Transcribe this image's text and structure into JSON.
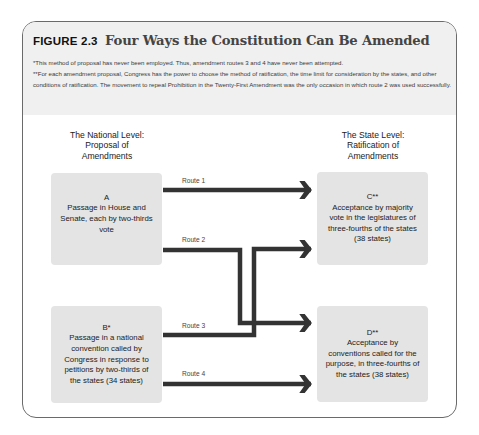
{
  "figure": {
    "label": "FIGURE 2.3",
    "title": "Four Ways the Constitution Can Be Amended",
    "notes": [
      "*This method of proposal has never been employed. Thus, amendment routes 3 and 4 have never been attempted.",
      "**For each amendment proposal, Congress has the power to choose the method of ratification, the time limit for consideration by the states, and other conditions of ratification. The movement to repeal Prohibition in the Twenty-First Amendment was the only occasion in which route 2 was used successfully."
    ]
  },
  "columns": {
    "national": {
      "line1": "The National Level:",
      "line2": "Proposal of",
      "line3": "Amendments"
    },
    "state": {
      "line1": "The State Level:",
      "line2": "Ratification of",
      "line3": "Amendments"
    }
  },
  "boxes": {
    "A": {
      "id": "A",
      "text": "Passage in House and Senate, each by two-thirds vote"
    },
    "B": {
      "id": "B*",
      "text": "Passage in a national convention called by Congress in response to petitions by two-thirds of the states (34 states)"
    },
    "C": {
      "id": "C**",
      "text": "Acceptance by majority vote in the legislatures of three-fourths of the states (38 states)"
    },
    "D": {
      "id": "D**",
      "text": "Acceptance by conventions called for the purpose, in three-fourths of the states (38 states)"
    }
  },
  "routes": [
    {
      "label": "Route 1",
      "from": "A",
      "to": "C"
    },
    {
      "label": "Route 2",
      "from": "A",
      "to": "D"
    },
    {
      "label": "Route 3",
      "from": "B",
      "to": "C"
    },
    {
      "label": "Route 4",
      "from": "B",
      "to": "D"
    }
  ],
  "colors": {
    "header_bg": "#f0f0f0",
    "box_bg": "#e4e4e4",
    "arrow": "#333333",
    "border": "#6a6a6a"
  }
}
